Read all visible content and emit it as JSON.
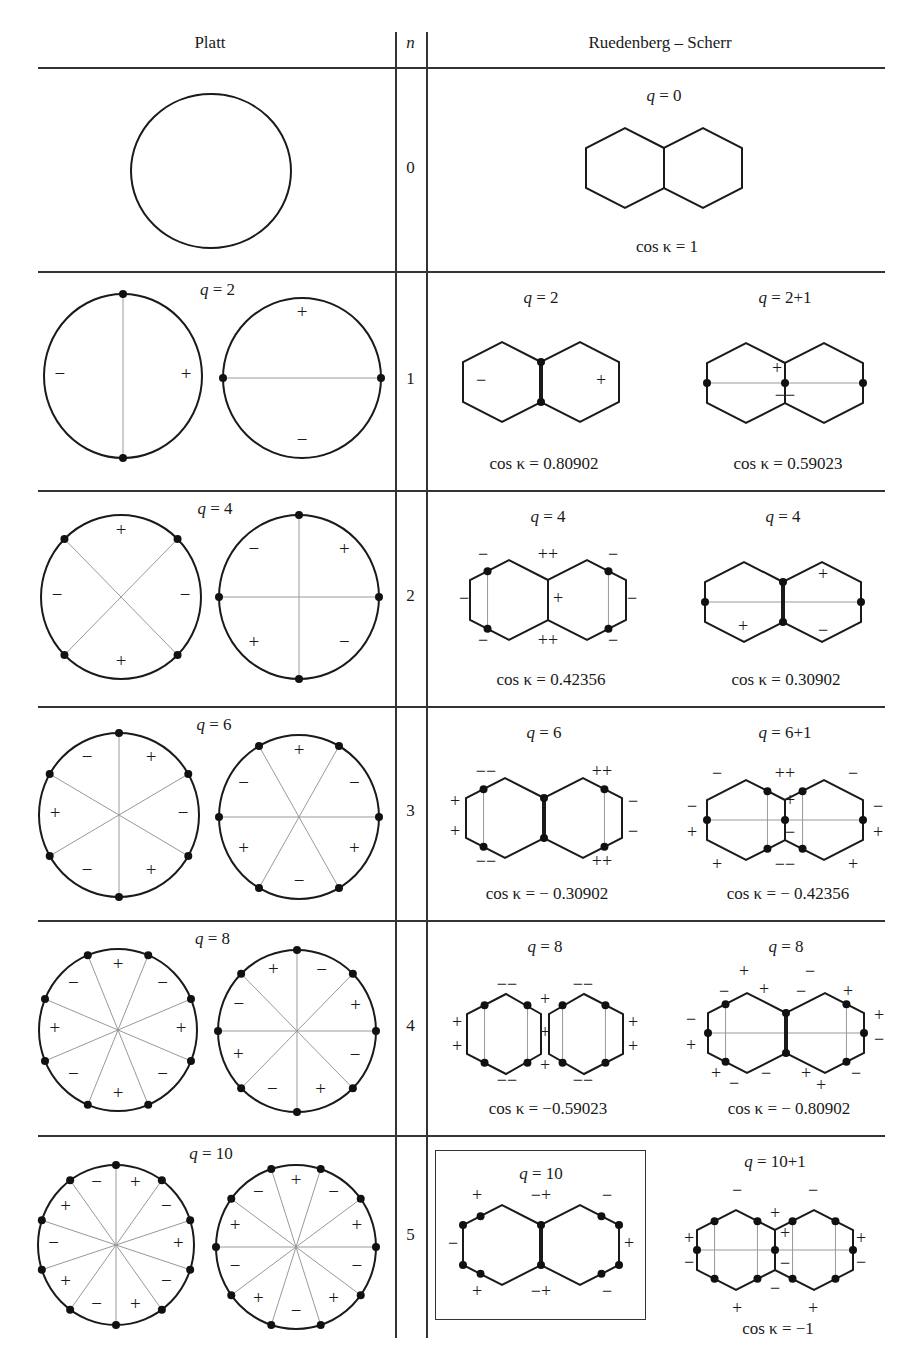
{
  "table": {
    "headers": {
      "platt": "Platt",
      "n": "n",
      "rs": "Ruedenberg – Scherr"
    },
    "rows": [
      {
        "n": "0",
        "platt": {
          "q_label": "",
          "circles": [
            {
              "cx": 211,
              "cy": 171,
              "rx": 80,
              "ry": 77,
              "k": 0,
              "offset": 0,
              "signs": []
            }
          ]
        },
        "rs": [
          {
            "q_label": "q = 0",
            "cos_label": "cos κ = 1",
            "cx": 664,
            "cy": 168,
            "boxed": false,
            "spec": "r0"
          }
        ]
      },
      {
        "n": "1",
        "platt": {
          "q_label": "q = 2",
          "circles": [
            {
              "cx": 123,
              "cy": 376,
              "rx": 79,
              "ry": 82,
              "k": 2,
              "offset": 90,
              "signs": [
                "−",
                "+"
              ],
              "sign_angles": [
                180,
                0
              ]
            },
            {
              "cx": 302,
              "cy": 378,
              "rx": 79,
              "ry": 80,
              "k": 2,
              "offset": 0,
              "signs": [
                "+",
                "−"
              ],
              "sign_angles": [
                90,
                270
              ]
            }
          ]
        },
        "rs": [
          {
            "q_label": "q = 2",
            "cos_label": "cos κ = 0.80902",
            "cx": 541,
            "cy": 382,
            "boxed": false,
            "spec": "r1a"
          },
          {
            "q_label": "q = 2+1",
            "cos_label": "cos κ = 0.59023",
            "cx": 785,
            "cy": 383,
            "boxed": false,
            "spec": "r1b"
          }
        ]
      },
      {
        "n": "2",
        "platt": {
          "q_label": "q = 4",
          "circles": [
            {
              "cx": 121,
              "cy": 597,
              "rx": 80,
              "ry": 82,
              "k": 4,
              "offset": 45,
              "signs": [
                "+",
                "−",
                "+",
                "−"
              ],
              "sign_angles": [
                90,
                180,
                270,
                0
              ]
            },
            {
              "cx": 299,
              "cy": 597,
              "rx": 80,
              "ry": 82,
              "k": 4,
              "offset": 0,
              "signs": [
                "+",
                "−",
                "+",
                "−"
              ],
              "sign_angles": [
                45,
                135,
                225,
                315
              ]
            }
          ]
        },
        "rs": [
          {
            "q_label": "q = 4",
            "cos_label": "cos κ = 0.42356",
            "cx": 548,
            "cy": 600,
            "boxed": false,
            "spec": "r2a"
          },
          {
            "q_label": "q = 4",
            "cos_label": "cos κ = 0.30902",
            "cx": 783,
            "cy": 602,
            "boxed": false,
            "spec": "r2b"
          }
        ]
      },
      {
        "n": "3",
        "platt": {
          "q_label": "q = 6",
          "circles": [
            {
              "cx": 119,
              "cy": 815,
              "rx": 80,
              "ry": 82,
              "k": 6,
              "offset": 30,
              "signs": [
                "+",
                "−",
                "+",
                "−",
                "+",
                "−"
              ],
              "sign_angles": [
                60,
                120,
                180,
                240,
                300,
                0
              ]
            },
            {
              "cx": 299,
              "cy": 817,
              "rx": 80,
              "ry": 82,
              "k": 6,
              "offset": 0,
              "signs": [
                "+",
                "−",
                "+",
                "−",
                "+",
                "−"
              ],
              "sign_angles": [
                90,
                150,
                210,
                270,
                330,
                30
              ]
            }
          ]
        },
        "rs": [
          {
            "q_label": "q = 6",
            "cos_label": "cos κ = − 0.30902",
            "cx": 544,
            "cy": 818,
            "boxed": false,
            "spec": "r3a"
          },
          {
            "q_label": "q = 6+1",
            "cos_label": "cos κ = − 0.42356",
            "cx": 785,
            "cy": 820,
            "boxed": false,
            "spec": "r3b"
          }
        ]
      },
      {
        "n": "4",
        "platt": {
          "q_label": "q = 8",
          "circles": [
            {
              "cx": 118,
              "cy": 1030,
              "rx": 79,
              "ry": 81,
              "k": 8,
              "offset": 22.5,
              "signs": [
                "+",
                "−",
                "+",
                "−",
                "+",
                "−",
                "+",
                "−"
              ],
              "sign_angles": [
                90,
                135,
                180,
                225,
                270,
                315,
                0,
                45
              ]
            },
            {
              "cx": 297,
              "cy": 1031,
              "rx": 79,
              "ry": 81,
              "k": 8,
              "offset": 0,
              "signs": [
                "+",
                "−",
                "+",
                "−",
                "+",
                "−",
                "+",
                "−"
              ],
              "sign_angles": [
                112,
                157,
                202,
                247,
                292,
                337,
                22,
                67
              ]
            }
          ]
        },
        "rs": [
          {
            "q_label": "q = 8",
            "cos_label": "cos κ = −0.59023",
            "cx": 545,
            "cy": 1034,
            "boxed": false,
            "spec": "r4a"
          },
          {
            "q_label": "q = 8",
            "cos_label": "cos κ = − 0.80902",
            "cx": 786,
            "cy": 1033,
            "boxed": false,
            "spec": "r4b"
          }
        ]
      },
      {
        "n": "5",
        "platt": {
          "q_label": "q = 10",
          "circles": [
            {
              "cx": 116,
              "cy": 1245,
              "rx": 78,
              "ry": 80,
              "k": 10,
              "offset": 18,
              "signs": [
                "+",
                "−",
                "+",
                "−",
                "+",
                "−",
                "+",
                "−",
                "+",
                "−"
              ],
              "sign_angles": [
                72,
                108,
                144,
                180,
                216,
                252,
                288,
                324,
                0,
                36
              ]
            },
            {
              "cx": 296,
              "cy": 1247,
              "rx": 80,
              "ry": 82,
              "k": 10,
              "offset": 0,
              "signs": [
                "+",
                "−",
                "+",
                "−",
                "+",
                "−",
                "+",
                "−",
                "+",
                "−"
              ],
              "sign_angles": [
                90,
                126,
                162,
                198,
                234,
                270,
                306,
                342,
                18,
                54
              ]
            }
          ]
        },
        "rs": [
          {
            "q_label": "q = 10",
            "cos_label": "",
            "cx": 541,
            "cy": 1245,
            "boxed": true,
            "spec": "r5a"
          },
          {
            "q_label": "q = 10+1",
            "cos_label": "cos κ = −1",
            "cx": 775,
            "cy": 1250,
            "boxed": false,
            "spec": "r5b"
          }
        ]
      }
    ]
  },
  "geometry": {
    "column_lines_x": [
      395,
      426
    ],
    "header_line_y": 68,
    "row_dividers_y": [
      271,
      490,
      706,
      920,
      1135
    ],
    "table_x_range": [
      38,
      885
    ],
    "table_bottom_y": 1338,
    "boxed_frame": {
      "x": 435,
      "y": 1150,
      "w": 211,
      "h": 170
    },
    "header_text_y": 45,
    "hexagon": {
      "half_width": 39,
      "side": 40
    }
  },
  "hex_specs": {
    "r0": {
      "dots": [],
      "bold_center": false,
      "lines": [],
      "signs": []
    },
    "r1a": {
      "dots": [
        "ct",
        "cb"
      ],
      "bold_center": true,
      "lines": [],
      "signs": [
        [
          "−",
          -60,
          0
        ],
        [
          "+",
          60,
          0
        ]
      ]
    },
    "r1b": {
      "dots": [
        "lm",
        "cm",
        "rm"
      ],
      "bold_center": false,
      "lines": [
        [
          "lm",
          "rm"
        ]
      ],
      "signs": [
        [
          "+",
          -8,
          -13
        ],
        [
          "−−",
          0,
          14
        ]
      ]
    },
    "r2a": {
      "dots": [
        "l_t",
        "l_b",
        "r_t",
        "r_b"
      ],
      "bold_center": false,
      "lines": [
        [
          "l_t",
          "l_b"
        ],
        [
          "r_t",
          "r_b"
        ]
      ],
      "signs": [
        [
          "−",
          -65,
          -44
        ],
        [
          "++",
          0,
          -44
        ],
        [
          "−",
          65,
          -44
        ],
        [
          "−",
          -84,
          0
        ],
        [
          "+",
          10,
          0
        ],
        [
          "−",
          84,
          0
        ],
        [
          "−",
          -65,
          42
        ],
        [
          "++",
          0,
          42
        ],
        [
          "−",
          65,
          42
        ]
      ]
    },
    "r2b": {
      "dots": [
        "ct",
        "cb",
        "lm",
        "rm"
      ],
      "bold_center": true,
      "lines": [
        [
          "lm",
          "rm"
        ]
      ],
      "signs": [
        [
          "+",
          40,
          -26
        ],
        [
          "+",
          -40,
          26
        ],
        [
          "−",
          40,
          30
        ]
      ]
    },
    "r3a": {
      "dots": [
        "ct",
        "cb",
        "l_t",
        "l_b",
        "r_t",
        "r_b"
      ],
      "bold_center": true,
      "lines": [
        [
          "l_t",
          "l_b"
        ],
        [
          "r_t",
          "r_b"
        ]
      ],
      "signs": [
        [
          "−−",
          -58,
          -45
        ],
        [
          "++",
          58,
          -45
        ],
        [
          "+",
          -89,
          -15
        ],
        [
          "−",
          89,
          -15
        ],
        [
          "+",
          -89,
          15
        ],
        [
          "−",
          89,
          15
        ],
        [
          "−−",
          -58,
          45
        ],
        [
          "++",
          58,
          45
        ]
      ]
    },
    "r3b": {
      "dots": [
        "lm",
        "cm",
        "rm",
        "li_t",
        "li_b",
        "ri_t",
        "ri_b"
      ],
      "bold_center": false,
      "lines": [
        [
          "lm",
          "rm"
        ],
        [
          "li_t",
          "li_b"
        ],
        [
          "ri_t",
          "ri_b"
        ]
      ],
      "signs": [
        [
          "−",
          -68,
          -45
        ],
        [
          "++",
          0,
          -45
        ],
        [
          "−",
          68,
          -45
        ],
        [
          "−",
          -93,
          -12
        ],
        [
          "−",
          93,
          -12
        ],
        [
          "+",
          -93,
          14
        ],
        [
          "+",
          93,
          14
        ],
        [
          "+",
          5,
          -18
        ],
        [
          "−",
          5,
          14
        ],
        [
          "+",
          -68,
          46
        ],
        [
          "−−",
          0,
          46
        ],
        [
          "+",
          68,
          46
        ]
      ]
    },
    "r4a": {
      "dots": [
        "l_t",
        "l_b",
        "li_t",
        "li_b",
        "ri_t",
        "ri_b",
        "r_t",
        "r_b"
      ],
      "bold_center": false,
      "lines": [
        [
          "l_t",
          "l_b"
        ],
        [
          "li_t",
          "li_b"
        ],
        [
          "ri_t",
          "ri_b"
        ],
        [
          "r_t",
          "r_b"
        ]
      ],
      "pinched": true,
      "signs": [
        [
          "−−",
          -38,
          -48
        ],
        [
          "−−",
          38,
          -48
        ],
        [
          "+",
          0,
          -33
        ],
        [
          "+",
          -88,
          -10
        ],
        [
          "+",
          88,
          -10
        ],
        [
          "+",
          0,
          0
        ],
        [
          "+",
          -88,
          14
        ],
        [
          "+",
          88,
          14
        ],
        [
          "+",
          0,
          33
        ],
        [
          "−−",
          -38,
          48
        ],
        [
          "−−",
          38,
          48
        ]
      ]
    },
    "r4b": {
      "dots": [
        "ct",
        "cb",
        "lm",
        "rm",
        "l_t",
        "l_b",
        "r_t",
        "r_b"
      ],
      "bold_center": true,
      "lines": [
        [
          "lm",
          "rm"
        ],
        [
          "l_t",
          "l_b"
        ],
        [
          "r_t",
          "r_b"
        ]
      ],
      "signs": [
        [
          "+",
          -42,
          -60
        ],
        [
          "−",
          24,
          -60
        ],
        [
          "−",
          -62,
          -40
        ],
        [
          "+",
          -22,
          -42
        ],
        [
          "−",
          15,
          -40
        ],
        [
          "+",
          62,
          -40
        ],
        [
          "−",
          -95,
          -12
        ],
        [
          "+",
          93,
          -16
        ],
        [
          "+",
          -95,
          14
        ],
        [
          "−",
          93,
          8
        ],
        [
          "+",
          -70,
          42
        ],
        [
          "−",
          -20,
          42
        ],
        [
          "+",
          20,
          42
        ],
        [
          "−",
          70,
          42
        ],
        [
          "−",
          -52,
          52
        ],
        [
          "+",
          35,
          54
        ]
      ]
    },
    "r5a": {
      "dots": [
        "ct",
        "cb",
        "l_t",
        "l_b",
        "r_t",
        "r_b",
        "lt",
        "lb",
        "rt",
        "rb"
      ],
      "bold_center": true,
      "lines": [],
      "signs": [
        [
          "+",
          -64,
          -48
        ],
        [
          "−+",
          0,
          -48
        ],
        [
          "−",
          66,
          -48
        ],
        [
          "−",
          -88,
          0
        ],
        [
          "+",
          88,
          0
        ],
        [
          "+",
          -64,
          48
        ],
        [
          "−+",
          0,
          48
        ],
        [
          "−",
          66,
          48
        ]
      ]
    },
    "r5b": {
      "dots": [
        "lm",
        "cm",
        "rm",
        "l_t",
        "l_b",
        "li_t",
        "li_b",
        "ri_t",
        "ri_b",
        "r_t",
        "r_b"
      ],
      "bold_center": false,
      "lines": [
        [
          "lm",
          "rm"
        ],
        [
          "l_t",
          "l_b"
        ],
        [
          "li_t",
          "li_b"
        ],
        [
          "ri_t",
          "ri_b"
        ],
        [
          "r_t",
          "r_b"
        ]
      ],
      "signs": [
        [
          "−",
          -38,
          -58
        ],
        [
          "−",
          38,
          -58
        ],
        [
          "+",
          0,
          -35
        ],
        [
          "+",
          10,
          -15
        ],
        [
          "−",
          10,
          15
        ],
        [
          "+",
          -86,
          -10
        ],
        [
          "+",
          86,
          -10
        ],
        [
          "−",
          -86,
          14
        ],
        [
          "−",
          86,
          14
        ],
        [
          "−",
          0,
          40
        ],
        [
          "+",
          -38,
          60
        ],
        [
          "+",
          38,
          60
        ]
      ]
    }
  }
}
